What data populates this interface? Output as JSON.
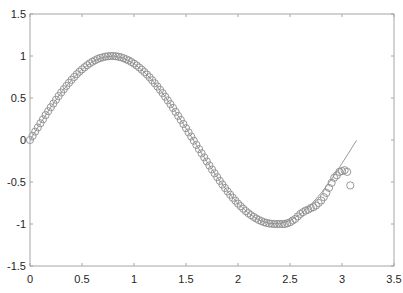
{
  "chart_data": {
    "type": "scatter",
    "title": "",
    "xlabel": "",
    "ylabel": "",
    "xlim": [
      0,
      3.5
    ],
    "ylim": [
      -1.5,
      1.5
    ],
    "grid": false,
    "legend": null,
    "x_ticks": [
      "0",
      "0.5",
      "1",
      "1.5",
      "2",
      "2.5",
      "3",
      "3.5"
    ],
    "y_ticks": [
      "1.5",
      "1",
      "0.5",
      "0",
      "-0.5",
      "-1",
      "-1.5"
    ],
    "series": [
      {
        "name": "line",
        "style": "line",
        "color": "#9a9a9a",
        "description": "smooth curve approximately sin(2x)",
        "x": [
          0,
          0.1,
          0.2,
          0.3,
          0.4,
          0.5,
          0.6,
          0.7,
          0.8,
          0.9,
          1.0,
          1.1,
          1.2,
          1.3,
          1.4,
          1.5,
          1.6,
          1.7,
          1.8,
          1.9,
          2.0,
          2.1,
          2.2,
          2.3,
          2.4,
          2.5,
          2.6,
          2.7,
          2.8,
          2.9,
          3.0,
          3.1,
          3.14
        ],
        "y": [
          0,
          0.199,
          0.389,
          0.565,
          0.717,
          0.841,
          0.932,
          0.985,
          1.0,
          0.974,
          0.909,
          0.808,
          0.675,
          0.516,
          0.335,
          0.141,
          -0.058,
          -0.256,
          -0.443,
          -0.612,
          -0.757,
          -0.872,
          -0.952,
          -0.994,
          -0.996,
          -0.959,
          -0.883,
          -0.773,
          -0.631,
          -0.465,
          -0.279,
          -0.083,
          -0.003
        ]
      },
      {
        "name": "samples",
        "style": "circle-markers",
        "color": "#8c8c8c",
        "x": [
          0,
          0.025,
          0.05,
          0.075,
          0.1,
          0.125,
          0.15,
          0.175,
          0.2,
          0.225,
          0.25,
          0.275,
          0.3,
          0.325,
          0.35,
          0.375,
          0.4,
          0.425,
          0.45,
          0.475,
          0.5,
          0.525,
          0.55,
          0.575,
          0.6,
          0.625,
          0.65,
          0.675,
          0.7,
          0.725,
          0.75,
          0.775,
          0.8,
          0.825,
          0.85,
          0.875,
          0.9,
          0.925,
          0.95,
          0.975,
          1.0,
          1.025,
          1.05,
          1.075,
          1.1,
          1.125,
          1.15,
          1.175,
          1.2,
          1.225,
          1.25,
          1.275,
          1.3,
          1.325,
          1.35,
          1.375,
          1.4,
          1.425,
          1.45,
          1.475,
          1.5,
          1.525,
          1.55,
          1.575,
          1.6,
          1.625,
          1.65,
          1.675,
          1.7,
          1.725,
          1.75,
          1.775,
          1.8,
          1.825,
          1.85,
          1.875,
          1.9,
          1.925,
          1.95,
          1.975,
          2.0,
          2.025,
          2.05,
          2.075,
          2.1,
          2.125,
          2.15,
          2.175,
          2.2,
          2.225,
          2.25,
          2.275,
          2.3,
          2.325,
          2.35,
          2.375,
          2.4,
          2.425,
          2.45,
          2.475,
          2.5,
          2.525,
          2.55,
          2.575,
          2.6,
          2.625,
          2.65,
          2.675,
          2.7,
          2.725,
          2.75,
          2.775,
          2.8,
          2.825,
          2.85,
          2.875,
          2.9,
          2.925,
          2.95,
          2.975,
          3.0,
          3.025,
          3.05,
          3.08
        ],
        "y": [
          0,
          0.05,
          0.1,
          0.149,
          0.199,
          0.247,
          0.296,
          0.343,
          0.389,
          0.434,
          0.479,
          0.523,
          0.565,
          0.605,
          0.644,
          0.681,
          0.717,
          0.75,
          0.783,
          0.813,
          0.841,
          0.867,
          0.891,
          0.913,
          0.932,
          0.949,
          0.964,
          0.976,
          0.985,
          0.993,
          0.997,
          1.0,
          1.0,
          0.997,
          0.992,
          0.984,
          0.974,
          0.961,
          0.946,
          0.929,
          0.909,
          0.887,
          0.863,
          0.837,
          0.808,
          0.778,
          0.746,
          0.711,
          0.675,
          0.637,
          0.598,
          0.558,
          0.516,
          0.472,
          0.427,
          0.382,
          0.335,
          0.287,
          0.239,
          0.19,
          0.141,
          0.091,
          0.042,
          -0.008,
          -0.058,
          -0.108,
          -0.158,
          -0.207,
          -0.256,
          -0.303,
          -0.351,
          -0.397,
          -0.443,
          -0.487,
          -0.53,
          -0.572,
          -0.612,
          -0.651,
          -0.688,
          -0.723,
          -0.757,
          -0.788,
          -0.818,
          -0.846,
          -0.872,
          -0.895,
          -0.916,
          -0.935,
          -0.952,
          -0.966,
          -0.978,
          -0.987,
          -0.994,
          -0.998,
          -1.0,
          -1.0,
          -1.0,
          -1.0,
          -1.0,
          -0.99,
          -0.98,
          -0.96,
          -0.94,
          -0.91,
          -0.88,
          -0.86,
          -0.84,
          -0.83,
          -0.81,
          -0.8,
          -0.78,
          -0.75,
          -0.72,
          -0.68,
          -0.63,
          -0.57,
          -0.51,
          -0.45,
          -0.42,
          -0.38,
          -0.37,
          -0.36,
          -0.38,
          -0.54
        ]
      }
    ]
  }
}
